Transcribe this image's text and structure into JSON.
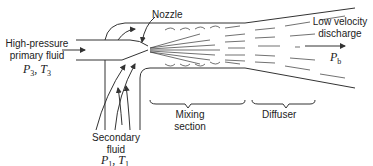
{
  "diagram": {
    "type": "ejector schematic",
    "labels": {
      "primary_fluid": [
        "High-pressure",
        "primary fluid"
      ],
      "primary_state": {
        "p": "P",
        "p_sub": "3",
        "t": "T",
        "t_sub": "3"
      },
      "nozzle": "Nozzle",
      "discharge": [
        "Low velocity",
        "discharge"
      ],
      "discharge_state": {
        "p": "P",
        "p_sub": "b"
      },
      "mixing_section": [
        "Mixing",
        "section"
      ],
      "diffuser": "Diffuser",
      "secondary_fluid": [
        "Secondary",
        "fluid"
      ],
      "secondary_state": {
        "p": "P",
        "p_sub": "1",
        "t": "T",
        "t_sub": "1"
      }
    },
    "colors": {
      "line": "#333333",
      "text": "#222222",
      "background": "#ffffff"
    }
  }
}
